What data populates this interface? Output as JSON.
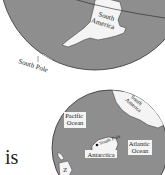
{
  "figure": {
    "top_globe": {
      "labels": {
        "continent": "South\nAmerica",
        "continent_line1": "South",
        "continent_line2": "America",
        "pole": "South Pole"
      }
    },
    "bottom_globe": {
      "labels": {
        "pacific_line1": "Pacific",
        "pacific_line2": "Ocean",
        "sa_line1": "South",
        "sa_line2": "America",
        "pole": "South Pole",
        "antarctica": "Antarctica",
        "atlantic_line1": "Atlantic",
        "atlantic_line2": "Ocean",
        "partial_label": "Z"
      }
    },
    "body_text_fragment": "is"
  },
  "colors": {
    "ocean": "#8e8e8e",
    "land": "#f4f4f4",
    "outline": "#333333",
    "background": "#ffffff"
  }
}
